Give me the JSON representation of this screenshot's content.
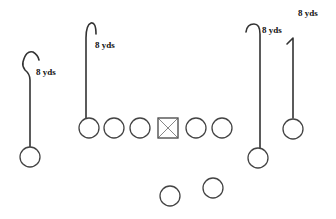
{
  "diagram": {
    "type": "football-play",
    "colors": {
      "stroke": "#444444",
      "route": "#333333",
      "text": "#111111",
      "background": "#ffffff"
    },
    "routes": [
      {
        "id": "left-wr",
        "label": "8 yds"
      },
      {
        "id": "left-slot",
        "label": "8 yds"
      },
      {
        "id": "right-te",
        "label": "8 yds"
      },
      {
        "id": "right-wr",
        "label": "8 yds"
      }
    ],
    "line": {
      "count_left_of_center": 3,
      "count_right_of_center": 2,
      "center_marker": "boxed-x"
    },
    "backs": 2
  }
}
